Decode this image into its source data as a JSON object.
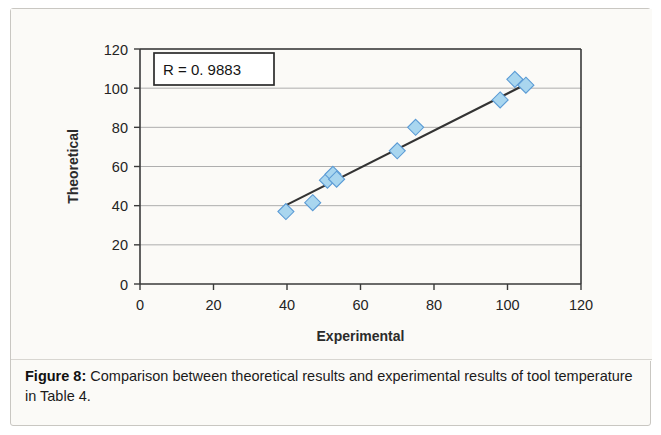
{
  "figure": {
    "caption_label": "Figure 8:",
    "caption_text": " Comparison between theoretical results and experimental results of tool temperature in Table 4."
  },
  "chart_data": {
    "type": "scatter",
    "title": "",
    "xlabel": "Experimental",
    "ylabel": "Theoretical",
    "xlim": [
      0,
      120
    ],
    "ylim": [
      0,
      120
    ],
    "xticks": [
      0,
      20,
      40,
      60,
      80,
      100,
      120
    ],
    "yticks": [
      0,
      20,
      40,
      60,
      80,
      100,
      120
    ],
    "grid": "horizontal",
    "legend": "none",
    "annotation": "R = 0. 9883",
    "marker_shape": "diamond",
    "marker_fill": "#a9d6ef",
    "marker_edge": "#5b9bd5",
    "trendline_color": "#333333",
    "series": [
      {
        "name": "Theoretical vs Experimental",
        "points": [
          {
            "x": 39.7,
            "y": 37.0
          },
          {
            "x": 47.0,
            "y": 41.5
          },
          {
            "x": 51.0,
            "y": 53.0
          },
          {
            "x": 52.5,
            "y": 56.0
          },
          {
            "x": 53.5,
            "y": 53.5
          },
          {
            "x": 70.0,
            "y": 68.0
          },
          {
            "x": 75.0,
            "y": 80.0
          },
          {
            "x": 98.0,
            "y": 94.0
          },
          {
            "x": 102.0,
            "y": 104.5
          },
          {
            "x": 105.0,
            "y": 101.5
          }
        ]
      }
    ],
    "trendline": {
      "x1": 39.5,
      "y1": 40.0,
      "x2": 105.5,
      "y2": 102.5
    }
  }
}
